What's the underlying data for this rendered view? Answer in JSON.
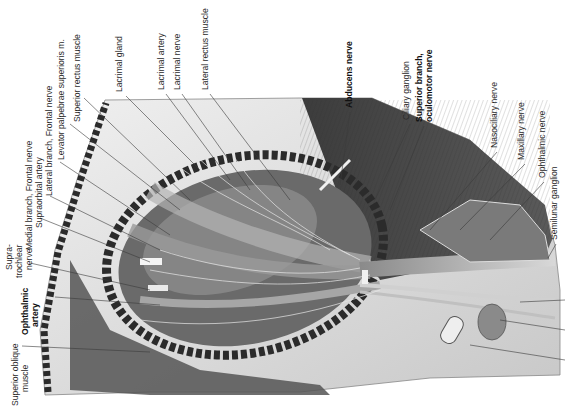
{
  "figure": {
    "colors": {
      "background": "#ffffff",
      "bone_light": "#e4e4e4",
      "tissue_dark": "#4a4a4a",
      "label_text": "#2a2a2a"
    }
  },
  "labels": {
    "superior_oblique": {
      "line1": "Superior oblique",
      "line2": "muscle",
      "x": 18,
      "y": 406
    },
    "ophthalmic_artery": {
      "line1": "Ophthalmic",
      "line2": "artery",
      "x": 52,
      "y": 335
    },
    "supratrochlear": {
      "line1": "Supra-",
      "line2": "trochlear",
      "line3": "nerve",
      "x": 18,
      "y": 278
    },
    "medial_branch_frontal": {
      "text": "Medial branch, Frontal nerve",
      "x": 36,
      "y": 250
    },
    "supraorbital_artery": {
      "text": "Supraorbital artery",
      "x": 46,
      "y": 228
    },
    "lateral_branch_frontal": {
      "text": "Lateral branch, Frontal nerve",
      "x": 56,
      "y": 195
    },
    "levator_palpebrae": {
      "text": "Levator palpebrae superioris m.",
      "x": 66,
      "y": 160
    },
    "superior_rectus": {
      "text": "Superior rectus muscle",
      "x": 80,
      "y": 122
    },
    "lacrimal_gland": {
      "text": "Lacrimal gland",
      "x": 124,
      "y": 92
    },
    "lacrimal_artery": {
      "text": "Lacrimal artery",
      "x": 166,
      "y": 90
    },
    "lacrimal_nerve": {
      "text": "Lacrimal nerve",
      "x": 180,
      "y": 90
    },
    "lateral_rectus": {
      "text": "Lateral rectus muscle",
      "x": 208,
      "y": 90
    },
    "abducens_nerve": {
      "text": "Abducens nerve",
      "x": 352,
      "y": 108
    },
    "ciliary_ganglion": {
      "text": "Ciliary ganglion",
      "x": 410,
      "y": 120
    },
    "superior_branch_oculomotor": {
      "line1": "Superior branch,",
      "line2": "oculomotor nerve",
      "x": 424,
      "y": 122
    },
    "nasociliary_nerve": {
      "text": "Nasociliary nerve",
      "x": 500,
      "y": 148
    },
    "maxillary_nerve": {
      "text": "Maxillary nerve",
      "x": 527,
      "y": 160
    },
    "ophthalmic_nerve": {
      "text": "Ophthalmic nerve",
      "x": 546,
      "y": 178
    },
    "semilunar_ganglion": {
      "text": "Semilunar ganglion",
      "x": 558,
      "y": 240
    }
  }
}
